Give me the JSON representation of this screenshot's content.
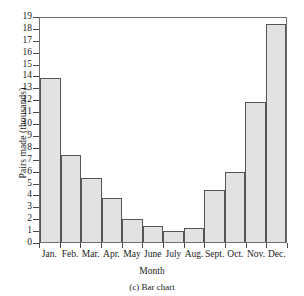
{
  "chart_data": {
    "type": "bar",
    "title": "",
    "caption": "(c) Bar chart",
    "xlabel": "Month",
    "ylabel": "Pairs made (thousands)",
    "categories": [
      "Jan.",
      "Feb.",
      "Mar.",
      "Apr.",
      "May",
      "June",
      "July",
      "Aug.",
      "Sept.",
      "Oct.",
      "Nov.",
      "Dec."
    ],
    "values": [
      13.9,
      7.4,
      5.4,
      3.7,
      1.95,
      1.4,
      0.9,
      1.2,
      4.4,
      5.9,
      11.9,
      18.5
    ],
    "ylim": [
      0,
      19
    ],
    "ytick_labels": [
      "19",
      "18",
      "17",
      "16",
      "15",
      "14",
      "13",
      "12",
      "11",
      "10",
      "9",
      "8",
      "7",
      "6",
      "5",
      "4",
      "3",
      "2",
      "1",
      "0"
    ],
    "ytick_values": [
      19,
      18,
      17,
      16,
      15,
      14,
      13,
      12,
      11,
      10,
      9,
      8,
      7,
      6,
      5,
      4,
      3,
      2,
      1,
      0
    ],
    "grid": false,
    "legend": false,
    "bar_fill_color": "#e2e2e2",
    "bar_edge_color": "#555555",
    "axis_color": "#6e6e6e",
    "background_color": "#ffffff"
  }
}
